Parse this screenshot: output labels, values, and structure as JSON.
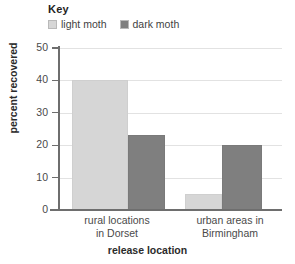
{
  "legend": {
    "title": "Key",
    "entries": [
      {
        "label": "light moth",
        "color": "#d6d6d6",
        "swatch_name": "legend-swatch-light-moth"
      },
      {
        "label": "dark moth",
        "color": "#7f7f7f",
        "swatch_name": "legend-swatch-dark-moth"
      }
    ]
  },
  "axes": {
    "y_title": "percent recovered",
    "x_title": "release location",
    "y_ticks": [
      "0",
      "10",
      "20",
      "30",
      "40",
      "50"
    ]
  },
  "categories": [
    {
      "line1": "rural locations",
      "line2": "in Dorset"
    },
    {
      "line1": "urban areas in",
      "line2": "Birmingham"
    }
  ],
  "chart_data": {
    "type": "bar",
    "title": "",
    "categories": [
      "rural locations in Dorset",
      "urban areas in Birmingham"
    ],
    "series": [
      {
        "name": "light moth",
        "values": [
          40,
          5
        ],
        "color": "#d6d6d6"
      },
      {
        "name": "dark moth",
        "values": [
          23,
          20
        ],
        "color": "#7f7f7f"
      }
    ],
    "xlabel": "release location",
    "ylabel": "percent recovered",
    "ylim": [
      0,
      50
    ],
    "yticks": [
      0,
      10,
      20,
      30,
      40,
      50
    ],
    "grid": "horizontal",
    "legend_position": "top-left",
    "legend_title": "Key"
  }
}
